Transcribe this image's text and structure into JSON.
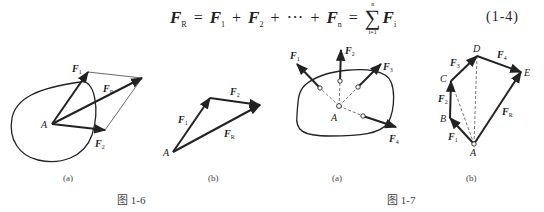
{
  "equation": {
    "lhs": {
      "symbol": "F",
      "sub": "R"
    },
    "terms": [
      {
        "symbol": "F",
        "sub": "1"
      },
      {
        "symbol": "F",
        "sub": "2"
      },
      {
        "symbol": "···",
        "sub": ""
      },
      {
        "symbol": "F",
        "sub": "n"
      }
    ],
    "sum": {
      "upper": "n",
      "lower": "i=1",
      "symbol": "F",
      "sub": "i"
    },
    "equals": "=",
    "plus": "+",
    "number": "(1-4)"
  },
  "figure_1_6": {
    "caption": "图 1-6",
    "panel_a": {
      "label": "(a)",
      "point": "A",
      "vectors": [
        {
          "name": "F",
          "sub": "1"
        },
        {
          "name": "F",
          "sub": "2"
        },
        {
          "name": "F",
          "sub": "R"
        }
      ]
    },
    "panel_b": {
      "label": "(b)",
      "point": "A",
      "vectors": [
        {
          "name": "F",
          "sub": "1"
        },
        {
          "name": "F",
          "sub": "2"
        },
        {
          "name": "F",
          "sub": "R"
        }
      ]
    }
  },
  "figure_1_7": {
    "caption": "图 1-7",
    "panel_a": {
      "label": "(a)",
      "point": "A",
      "vectors": [
        {
          "name": "F",
          "sub": "1"
        },
        {
          "name": "F",
          "sub": "2"
        },
        {
          "name": "F",
          "sub": "3"
        },
        {
          "name": "F",
          "sub": "4"
        }
      ]
    },
    "panel_b": {
      "label": "(b)",
      "points": [
        "A",
        "B",
        "C",
        "D",
        "E"
      ],
      "vectors": [
        {
          "name": "F",
          "sub": "1"
        },
        {
          "name": "F",
          "sub": "2"
        },
        {
          "name": "F",
          "sub": "3"
        },
        {
          "name": "F",
          "sub": "4"
        },
        {
          "name": "F",
          "sub": "R"
        }
      ]
    }
  }
}
